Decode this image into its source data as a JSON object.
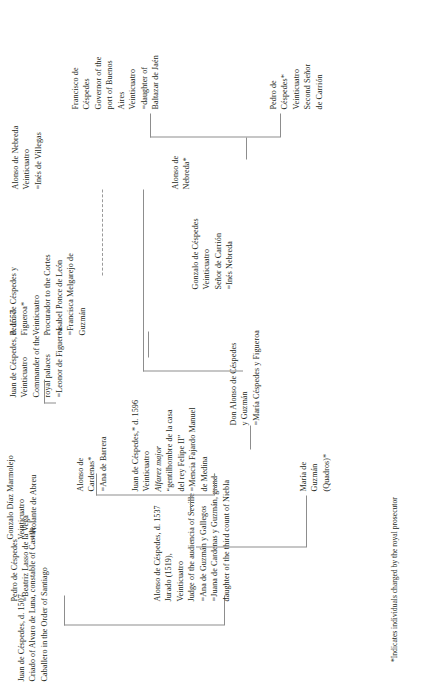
{
  "chart": {
    "type": "genealogy-tree",
    "orientation": "rotated-90-ccw",
    "line_color": "#8d8d8d",
    "text_color": "#231f20",
    "footnote": "*Indicates individuals charged by the royal prosecutor"
  },
  "nodes": {
    "juan_1507": {
      "lines": [
        "Juan de Céspedes, d. 1507",
        "Criado of Alvaro de Luna, constable of Castile",
        "Caballero in the Order of Santiago"
      ]
    },
    "pedro_beatriz": {
      "lines": [
        "Pedro de Céspedes",
        "=Beatriz Lasso de la Vega"
      ]
    },
    "alonso_1537": {
      "lines": [
        "Alonso de Céspedes, d. 1537",
        "Jurado (1519),",
        "Veinticuatro",
        "Judge of the audiencia of Seville",
        "=Ana de Guzmán y Gallegos",
        "=Juana de Cardenas y Guzmán, grand-",
        "daughter of the third count of Niebla"
      ]
    },
    "maria_guzman": {
      "lines": [
        "María de",
        "Guzmán",
        "(Quadros)*"
      ]
    },
    "juan_1596": {
      "lines": [
        "Juan de Céspedes,* d. 1596",
        "Veinticuatro",
        "Alfarez major",
        "“gentilhombre de la casa",
        "del rey Felipe II”",
        "=Mencia Fajardo Manuel",
        "de Medina"
      ],
      "italic_line_index": 2
    },
    "alonso_cardenas": {
      "lines": [
        "Alonso de",
        "Cardenas*",
        "=Ana de Barrera"
      ]
    },
    "don_alonso": {
      "lines": [
        "Don Alonso de Céspedes",
        "y Guzmán",
        "=María Céspedes y Figueroa"
      ]
    },
    "gonzalo_marmolejo": {
      "lines": [
        "Gonzalo Díaz Marmolejo",
        "Veinticuatro",
        "=Violante de Abreu"
      ]
    },
    "juan_1557": {
      "lines": [
        "Juan de Céspedes, d. 1557",
        "Veinticuatro",
        "Commander of the",
        "royal palaces",
        "=Leonor de Figueroa"
      ]
    },
    "pedro_figueroa": {
      "lines": [
        "Pedro de Céspedes y",
        "Figueroa*",
        "Veinticuatro",
        "Procurador to the Cortes",
        "=Isabel Ponce de León",
        "=Francisca Melgarejo de",
        "Guzmán"
      ]
    },
    "alonso_nebreda_top": {
      "lines": [
        "Alonso de Nebreda",
        "Veinticuatro",
        "=Inés de Villegas"
      ]
    },
    "alonso_nebreda_star": {
      "lines": [
        "Alonso de",
        "Nebreda*"
      ]
    },
    "gonzalo_cespedes": {
      "lines": [
        "Gonzalo de Céspedes",
        "Veinticuatro",
        "Señor de Carrión",
        "=Inés Nebreda"
      ]
    },
    "pedro_cespedes_star": {
      "lines": [
        "Pedro de",
        "Céspedes*",
        "Veinticuatro",
        "Second Señor",
        "de Carrión"
      ]
    },
    "francisco_cespedes": {
      "lines": [
        "Francisco de",
        "Céspedes",
        "Governor of the",
        "port of Buenos",
        "Aires",
        "Veinticuatro",
        "=daughter of",
        "Baltazar de Jaén"
      ]
    }
  }
}
